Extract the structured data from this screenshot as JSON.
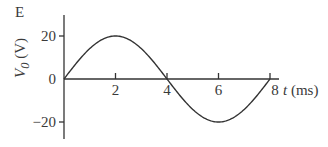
{
  "panel_label": "E",
  "chart_data": {
    "type": "line",
    "title": "",
    "xlabel": "t (ms)",
    "ylabel": "V0 (V)",
    "xlabel_var": "t",
    "xlabel_unit": "(ms)",
    "ylabel_var": "V",
    "ylabel_sub": "0",
    "ylabel_unit": "(V)",
    "xlim": [
      0,
      8.3
    ],
    "ylim": [
      -30,
      25
    ],
    "x_ticks": [
      2,
      4,
      6,
      8
    ],
    "y_ticks": [
      20,
      0,
      -20
    ],
    "x_tick_labels": [
      "2",
      "4",
      "6",
      "8"
    ],
    "y_tick_labels": [
      "20",
      "0",
      "−20"
    ],
    "grid": false,
    "legend": null,
    "series": [
      {
        "name": "V0(t)",
        "description": "Sine wave, amplitude 20 V, period 8 ms",
        "x": [
          0,
          1,
          2,
          3,
          4,
          5,
          6,
          7,
          8
        ],
        "values": [
          0,
          14.1,
          20,
          14.1,
          0,
          -14.1,
          -20,
          -14.1,
          0
        ]
      }
    ],
    "color": "#333333"
  }
}
